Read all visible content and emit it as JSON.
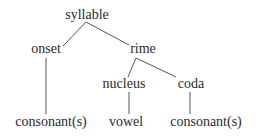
{
  "diagram": {
    "type": "tree",
    "title": "",
    "nodes": {
      "syllable": {
        "label": "syllable"
      },
      "onset": {
        "label": "onset"
      },
      "rime": {
        "label": "rime"
      },
      "nucleus": {
        "label": "nucleus"
      },
      "coda": {
        "label": "coda"
      },
      "onset_consonants": {
        "label": "consonant(s)"
      },
      "vowel": {
        "label": "vowel"
      },
      "coda_consonants": {
        "label": "consonant(s)"
      }
    },
    "edges": [
      [
        "syllable",
        "onset"
      ],
      [
        "syllable",
        "rime"
      ],
      [
        "onset",
        "onset_consonants"
      ],
      [
        "rime",
        "nucleus"
      ],
      [
        "rime",
        "coda"
      ],
      [
        "nucleus",
        "vowel"
      ],
      [
        "coda",
        "coda_consonants"
      ]
    ],
    "colors": {
      "text": "#2b2b2b",
      "line": "#555555",
      "background": "#ffffff"
    }
  }
}
